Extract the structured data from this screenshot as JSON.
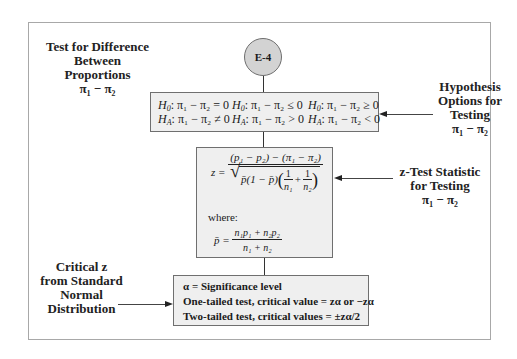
{
  "diagram": {
    "node_id": "E-4",
    "title_label": {
      "line1": "Test for  Difference",
      "line2": "Between Proportions",
      "line3": "π₁ − π₂"
    },
    "hypothesis_box": {
      "h0": [
        "H₀: π₁ − π₂ = 0",
        "H₀: π₁ − π₂ ≤ 0",
        "H₀: π₁ − π₂ ≥ 0"
      ],
      "ha": [
        "H_A: π₁ − π₂ ≠ 0",
        "H_A: π₁ − π₂ > 0",
        "H_A: π₁ − π₂ < 0"
      ],
      "h0_prefix": "H",
      "h0_sub": "0",
      "ha_prefix": "H",
      "ha_sub": "A",
      "h0_rel": [
        ": π₁ − π₂ = 0",
        ": π₁ − π₂ ≤ 0",
        ": π₁ − π₂ ≥ 0"
      ],
      "ha_rel": [
        ": π₁ − π₂ ≠ 0",
        ": π₁ − π₂ > 0",
        ": π₁ − π₂ < 0"
      ]
    },
    "hypothesis_label": {
      "line1": "Hypothesis",
      "line2": "Options for",
      "line3": "Testing",
      "line4": "π₁ − π₂"
    },
    "formula_box": {
      "z_lhs": "z =",
      "z_numerator": "(p₁ − p₂) − (π₁ − π₂)",
      "z_den_left": "p̄(1 − p̄)",
      "z_den_frac1_num": "1",
      "z_den_frac1_den": "n₁",
      "z_den_plus": "+",
      "z_den_frac2_num": "1",
      "z_den_frac2_den": "n₂",
      "where_label": "where:",
      "pbar_lhs": "p̄ =",
      "pbar_numerator": "n₁p₁ + n₂p₂",
      "pbar_denominator": "n₁ + n₂"
    },
    "formula_label": {
      "line1": "z-Test Statistic",
      "line2": "for Testing",
      "line3": "π₁ − π₂"
    },
    "critical_box": {
      "line1": "α = Significance level",
      "line2": "One-tailed test, critical value = zα or −zα",
      "line3": "Two-tailed test, critical values = ±zα/2"
    },
    "critical_label": {
      "line1": "Critical z",
      "line2": "from Standard",
      "line3": "Normal",
      "line4": "Distribution"
    },
    "colors": {
      "node_fill": "#d3d3d3",
      "box_fill": "#efefef",
      "box_border": "#6f6f6f",
      "frame_border": "#a8a8a8"
    }
  }
}
